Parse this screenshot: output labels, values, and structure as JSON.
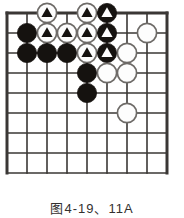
{
  "figure": {
    "kind": "go-board-diagram",
    "caption": "图4-19、11A",
    "background_color": "#ffffff"
  },
  "board": {
    "columns": 9,
    "rows": 9,
    "origin_x": 7,
    "origin_y": 13,
    "spacing": 20,
    "line_color": "#3a3735",
    "line_width": 1.6,
    "edge_line_width": 3.0,
    "stone_radius": 9.6,
    "black_color": "#15120f",
    "white_color": "#fdfdfd",
    "white_outline_color": "#6e6b68",
    "marker_black_color": "#15120f",
    "marker_white_color": "#fdfdfd"
  },
  "stones": [
    {
      "name": "white-stone-marked-c2r0",
      "col": 2,
      "row": 0,
      "color": "white",
      "marker": "triangle",
      "marker_color": "black"
    },
    {
      "name": "white-stone-marked-c4r0",
      "col": 4,
      "row": 0,
      "color": "white",
      "marker": "triangle",
      "marker_color": "black"
    },
    {
      "name": "black-stone-marked-c5r0",
      "col": 5,
      "row": 0,
      "color": "black",
      "marker": "triangle",
      "marker_color": "white"
    },
    {
      "name": "black-stone-c1r1",
      "col": 1,
      "row": 1,
      "color": "black",
      "marker": "none",
      "marker_color": ""
    },
    {
      "name": "white-stone-marked-c2r1",
      "col": 2,
      "row": 1,
      "color": "white",
      "marker": "triangle",
      "marker_color": "black"
    },
    {
      "name": "white-stone-marked-c3r1",
      "col": 3,
      "row": 1,
      "color": "white",
      "marker": "triangle",
      "marker_color": "black"
    },
    {
      "name": "white-stone-marked-c4r1",
      "col": 4,
      "row": 1,
      "color": "white",
      "marker": "triangle",
      "marker_color": "black"
    },
    {
      "name": "black-stone-marked-c5r1",
      "col": 5,
      "row": 1,
      "color": "black",
      "marker": "triangle",
      "marker_color": "white"
    },
    {
      "name": "white-stone-c7r1",
      "col": 7,
      "row": 1,
      "color": "white",
      "marker": "none",
      "marker_color": ""
    },
    {
      "name": "black-stone-c1r2",
      "col": 1,
      "row": 2,
      "color": "black",
      "marker": "none",
      "marker_color": ""
    },
    {
      "name": "black-stone-c2r2",
      "col": 2,
      "row": 2,
      "color": "black",
      "marker": "none",
      "marker_color": ""
    },
    {
      "name": "black-stone-c3r2",
      "col": 3,
      "row": 2,
      "color": "black",
      "marker": "none",
      "marker_color": ""
    },
    {
      "name": "white-stone-marked-c4r2",
      "col": 4,
      "row": 2,
      "color": "white",
      "marker": "triangle",
      "marker_color": "black"
    },
    {
      "name": "black-stone-marked-c5r2",
      "col": 5,
      "row": 2,
      "color": "black",
      "marker": "triangle",
      "marker_color": "white"
    },
    {
      "name": "white-stone-c6r2",
      "col": 6,
      "row": 2,
      "color": "white",
      "marker": "none",
      "marker_color": ""
    },
    {
      "name": "black-stone-c4r3",
      "col": 4,
      "row": 3,
      "color": "black",
      "marker": "none",
      "marker_color": ""
    },
    {
      "name": "white-stone-c5r3",
      "col": 5,
      "row": 3,
      "color": "white",
      "marker": "none",
      "marker_color": ""
    },
    {
      "name": "white-stone-c6r3",
      "col": 6,
      "row": 3,
      "color": "white",
      "marker": "none",
      "marker_color": ""
    },
    {
      "name": "black-stone-c4r4",
      "col": 4,
      "row": 4,
      "color": "black",
      "marker": "none",
      "marker_color": ""
    },
    {
      "name": "white-stone-c6r5",
      "col": 6,
      "row": 5,
      "color": "white",
      "marker": "none",
      "marker_color": ""
    }
  ]
}
